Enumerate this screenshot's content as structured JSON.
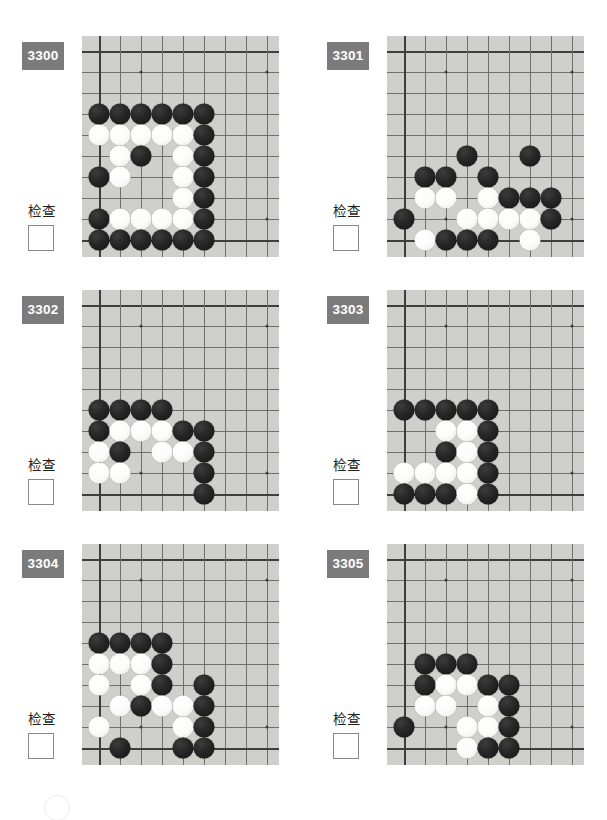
{
  "page": {
    "type": "go-problem-worksheet",
    "width": 607,
    "height": 820,
    "board_background_color": "#cfd0cb",
    "label_background_color": "#7b7b7b",
    "label_text_color": "#ffffff",
    "grid_line_color": "#6f7169",
    "board_edge_color": "#3d4039",
    "stone_black_color": "#1a1a1a",
    "stone_white_color": "#fbfbf9",
    "check_label": "检查",
    "grid": {
      "cols": 9,
      "rows": 10,
      "spacing": 21,
      "origin_x": 17,
      "origin_y": 15
    },
    "star_points": [
      {
        "c": 2,
        "r": 1
      },
      {
        "c": 8,
        "r": 1
      },
      {
        "c": 2,
        "r": 8
      },
      {
        "c": 8,
        "r": 8
      }
    ]
  },
  "problems": [
    {
      "id": "3300",
      "check_label": "检查",
      "checked": false,
      "stones": [
        {
          "c": 0,
          "r": 3,
          "color": "b"
        },
        {
          "c": 1,
          "r": 3,
          "color": "b"
        },
        {
          "c": 2,
          "r": 3,
          "color": "b"
        },
        {
          "c": 3,
          "r": 3,
          "color": "b"
        },
        {
          "c": 4,
          "r": 3,
          "color": "b"
        },
        {
          "c": 5,
          "r": 3,
          "color": "b"
        },
        {
          "c": 0,
          "r": 4,
          "color": "w"
        },
        {
          "c": 1,
          "r": 4,
          "color": "w"
        },
        {
          "c": 2,
          "r": 4,
          "color": "w"
        },
        {
          "c": 3,
          "r": 4,
          "color": "w"
        },
        {
          "c": 4,
          "r": 4,
          "color": "w"
        },
        {
          "c": 5,
          "r": 4,
          "color": "b"
        },
        {
          "c": 1,
          "r": 5,
          "color": "w"
        },
        {
          "c": 2,
          "r": 5,
          "color": "b"
        },
        {
          "c": 4,
          "r": 5,
          "color": "w"
        },
        {
          "c": 5,
          "r": 5,
          "color": "b"
        },
        {
          "c": 0,
          "r": 6,
          "color": "b"
        },
        {
          "c": 1,
          "r": 6,
          "color": "w"
        },
        {
          "c": 4,
          "r": 6,
          "color": "w"
        },
        {
          "c": 5,
          "r": 6,
          "color": "b"
        },
        {
          "c": 4,
          "r": 7,
          "color": "w"
        },
        {
          "c": 5,
          "r": 7,
          "color": "b"
        },
        {
          "c": 0,
          "r": 8,
          "color": "b"
        },
        {
          "c": 1,
          "r": 8,
          "color": "w"
        },
        {
          "c": 2,
          "r": 8,
          "color": "w"
        },
        {
          "c": 3,
          "r": 8,
          "color": "w"
        },
        {
          "c": 4,
          "r": 8,
          "color": "w"
        },
        {
          "c": 5,
          "r": 8,
          "color": "b"
        },
        {
          "c": 0,
          "r": 9,
          "color": "b"
        },
        {
          "c": 1,
          "r": 9,
          "color": "b"
        },
        {
          "c": 2,
          "r": 9,
          "color": "b"
        },
        {
          "c": 3,
          "r": 9,
          "color": "b"
        },
        {
          "c": 4,
          "r": 9,
          "color": "b"
        },
        {
          "c": 5,
          "r": 9,
          "color": "b"
        }
      ]
    },
    {
      "id": "3301",
      "check_label": "检查",
      "checked": false,
      "stones": [
        {
          "c": 3,
          "r": 5,
          "color": "b"
        },
        {
          "c": 6,
          "r": 5,
          "color": "b"
        },
        {
          "c": 1,
          "r": 6,
          "color": "b"
        },
        {
          "c": 2,
          "r": 6,
          "color": "b"
        },
        {
          "c": 4,
          "r": 6,
          "color": "b"
        },
        {
          "c": 1,
          "r": 7,
          "color": "w"
        },
        {
          "c": 2,
          "r": 7,
          "color": "w"
        },
        {
          "c": 4,
          "r": 7,
          "color": "w"
        },
        {
          "c": 5,
          "r": 7,
          "color": "b"
        },
        {
          "c": 6,
          "r": 7,
          "color": "b"
        },
        {
          "c": 7,
          "r": 7,
          "color": "b"
        },
        {
          "c": 0,
          "r": 8,
          "color": "b"
        },
        {
          "c": 3,
          "r": 8,
          "color": "w"
        },
        {
          "c": 4,
          "r": 8,
          "color": "w"
        },
        {
          "c": 5,
          "r": 8,
          "color": "w"
        },
        {
          "c": 6,
          "r": 8,
          "color": "w"
        },
        {
          "c": 7,
          "r": 8,
          "color": "b"
        },
        {
          "c": 1,
          "r": 9,
          "color": "w"
        },
        {
          "c": 2,
          "r": 9,
          "color": "b"
        },
        {
          "c": 3,
          "r": 9,
          "color": "b"
        },
        {
          "c": 4,
          "r": 9,
          "color": "b"
        },
        {
          "c": 6,
          "r": 9,
          "color": "w"
        }
      ]
    },
    {
      "id": "3302",
      "check_label": "检查",
      "checked": false,
      "stones": [
        {
          "c": 0,
          "r": 5,
          "color": "b"
        },
        {
          "c": 1,
          "r": 5,
          "color": "b"
        },
        {
          "c": 2,
          "r": 5,
          "color": "b"
        },
        {
          "c": 3,
          "r": 5,
          "color": "b"
        },
        {
          "c": 0,
          "r": 6,
          "color": "b"
        },
        {
          "c": 1,
          "r": 6,
          "color": "w"
        },
        {
          "c": 2,
          "r": 6,
          "color": "w"
        },
        {
          "c": 3,
          "r": 6,
          "color": "w"
        },
        {
          "c": 4,
          "r": 6,
          "color": "b"
        },
        {
          "c": 5,
          "r": 6,
          "color": "b"
        },
        {
          "c": 0,
          "r": 7,
          "color": "w"
        },
        {
          "c": 1,
          "r": 7,
          "color": "b"
        },
        {
          "c": 3,
          "r": 7,
          "color": "w"
        },
        {
          "c": 4,
          "r": 7,
          "color": "w"
        },
        {
          "c": 5,
          "r": 7,
          "color": "b"
        },
        {
          "c": 0,
          "r": 8,
          "color": "w"
        },
        {
          "c": 1,
          "r": 8,
          "color": "w"
        },
        {
          "c": 5,
          "r": 8,
          "color": "b"
        },
        {
          "c": 5,
          "r": 9,
          "color": "b"
        }
      ]
    },
    {
      "id": "3303",
      "check_label": "检查",
      "checked": false,
      "stones": [
        {
          "c": 0,
          "r": 5,
          "color": "b"
        },
        {
          "c": 1,
          "r": 5,
          "color": "b"
        },
        {
          "c": 2,
          "r": 5,
          "color": "b"
        },
        {
          "c": 3,
          "r": 5,
          "color": "b"
        },
        {
          "c": 4,
          "r": 5,
          "color": "b"
        },
        {
          "c": 2,
          "r": 6,
          "color": "w"
        },
        {
          "c": 3,
          "r": 6,
          "color": "w"
        },
        {
          "c": 4,
          "r": 6,
          "color": "b"
        },
        {
          "c": 2,
          "r": 7,
          "color": "b"
        },
        {
          "c": 3,
          "r": 7,
          "color": "w"
        },
        {
          "c": 4,
          "r": 7,
          "color": "b"
        },
        {
          "c": 0,
          "r": 8,
          "color": "w"
        },
        {
          "c": 1,
          "r": 8,
          "color": "w"
        },
        {
          "c": 2,
          "r": 8,
          "color": "w"
        },
        {
          "c": 3,
          "r": 8,
          "color": "w"
        },
        {
          "c": 4,
          "r": 8,
          "color": "b"
        },
        {
          "c": 0,
          "r": 9,
          "color": "b"
        },
        {
          "c": 1,
          "r": 9,
          "color": "b"
        },
        {
          "c": 2,
          "r": 9,
          "color": "b"
        },
        {
          "c": 3,
          "r": 9,
          "color": "w"
        },
        {
          "c": 4,
          "r": 9,
          "color": "b"
        }
      ]
    },
    {
      "id": "3304",
      "check_label": "检查",
      "checked": false,
      "stones": [
        {
          "c": 0,
          "r": 4,
          "color": "b"
        },
        {
          "c": 1,
          "r": 4,
          "color": "b"
        },
        {
          "c": 2,
          "r": 4,
          "color": "b"
        },
        {
          "c": 3,
          "r": 4,
          "color": "b"
        },
        {
          "c": 0,
          "r": 5,
          "color": "w"
        },
        {
          "c": 1,
          "r": 5,
          "color": "w"
        },
        {
          "c": 2,
          "r": 5,
          "color": "w"
        },
        {
          "c": 3,
          "r": 5,
          "color": "b"
        },
        {
          "c": 0,
          "r": 6,
          "color": "w"
        },
        {
          "c": 2,
          "r": 6,
          "color": "w"
        },
        {
          "c": 3,
          "r": 6,
          "color": "b"
        },
        {
          "c": 5,
          "r": 6,
          "color": "b"
        },
        {
          "c": 1,
          "r": 7,
          "color": "w"
        },
        {
          "c": 2,
          "r": 7,
          "color": "b"
        },
        {
          "c": 3,
          "r": 7,
          "color": "w"
        },
        {
          "c": 4,
          "r": 7,
          "color": "w"
        },
        {
          "c": 5,
          "r": 7,
          "color": "b"
        },
        {
          "c": 0,
          "r": 8,
          "color": "w"
        },
        {
          "c": 4,
          "r": 8,
          "color": "w"
        },
        {
          "c": 5,
          "r": 8,
          "color": "b"
        },
        {
          "c": 1,
          "r": 9,
          "color": "b"
        },
        {
          "c": 4,
          "r": 9,
          "color": "b"
        },
        {
          "c": 5,
          "r": 9,
          "color": "b"
        }
      ]
    },
    {
      "id": "3305",
      "check_label": "检查",
      "checked": false,
      "stones": [
        {
          "c": 1,
          "r": 5,
          "color": "b"
        },
        {
          "c": 2,
          "r": 5,
          "color": "b"
        },
        {
          "c": 3,
          "r": 5,
          "color": "b"
        },
        {
          "c": 1,
          "r": 6,
          "color": "b"
        },
        {
          "c": 2,
          "r": 6,
          "color": "w"
        },
        {
          "c": 3,
          "r": 6,
          "color": "w"
        },
        {
          "c": 4,
          "r": 6,
          "color": "b"
        },
        {
          "c": 5,
          "r": 6,
          "color": "b"
        },
        {
          "c": 1,
          "r": 7,
          "color": "w"
        },
        {
          "c": 2,
          "r": 7,
          "color": "w"
        },
        {
          "c": 4,
          "r": 7,
          "color": "w"
        },
        {
          "c": 5,
          "r": 7,
          "color": "b"
        },
        {
          "c": 0,
          "r": 8,
          "color": "b"
        },
        {
          "c": 3,
          "r": 8,
          "color": "w"
        },
        {
          "c": 4,
          "r": 8,
          "color": "w"
        },
        {
          "c": 5,
          "r": 8,
          "color": "b"
        },
        {
          "c": 3,
          "r": 9,
          "color": "w"
        },
        {
          "c": 4,
          "r": 9,
          "color": "b"
        },
        {
          "c": 5,
          "r": 9,
          "color": "b"
        }
      ]
    }
  ]
}
